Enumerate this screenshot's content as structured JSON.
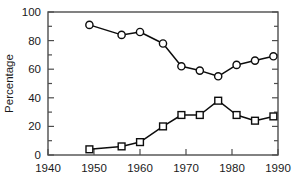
{
  "chart_data": {
    "type": "line",
    "title": "",
    "xlabel": "",
    "ylabel": "Percentage",
    "xlim": [
      1940,
      1990
    ],
    "ylim": [
      0,
      100
    ],
    "grid": false,
    "legend": "none",
    "x_ticks": [
      1940,
      1950,
      1960,
      1970,
      1980,
      1990
    ],
    "x_tick_labels": [
      "1940",
      "1950",
      "1960",
      "1970",
      "1980",
      "1990"
    ],
    "x_minor_ticks": [
      1945,
      1955,
      1965,
      1975,
      1985
    ],
    "y_ticks": [
      0,
      20,
      40,
      60,
      80,
      100
    ],
    "y_tick_labels": [
      "0",
      "20",
      "40",
      "60",
      "80",
      "100"
    ],
    "y_minor_ticks": [
      10,
      30,
      50,
      70,
      90
    ],
    "series": [
      {
        "name": "upper-series",
        "marker": "circle",
        "x": [
          1949,
          1956,
          1960,
          1965,
          1969,
          1973,
          1977,
          1981,
          1985,
          1989
        ],
        "values": [
          91,
          84,
          86,
          78,
          62,
          59,
          55,
          63,
          66,
          69
        ]
      },
      {
        "name": "lower-series",
        "marker": "square",
        "x": [
          1949,
          1956,
          1960,
          1965,
          1969,
          1973,
          1977,
          1981,
          1985,
          1989
        ],
        "values": [
          4,
          6,
          9,
          20,
          28,
          28,
          38,
          28,
          24,
          27
        ]
      }
    ]
  }
}
